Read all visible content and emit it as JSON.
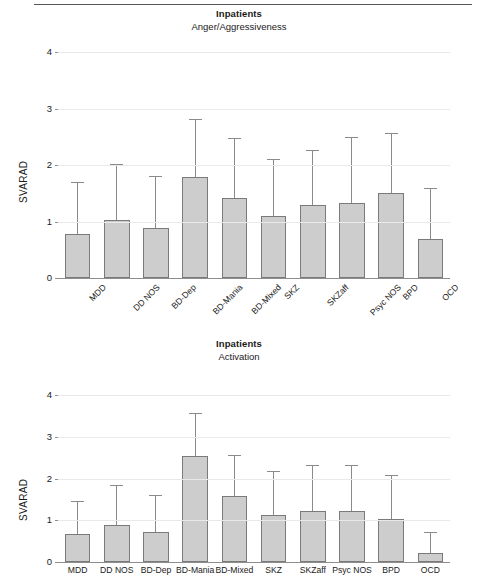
{
  "figure": {
    "panels": [
      {
        "id": "anger",
        "title": "Inpatients",
        "subtitle": "Anger/Aggressiveness",
        "ylabel": "SVARAD"
      },
      {
        "id": "activation",
        "title": "Inpatients",
        "subtitle": "Activation",
        "ylabel": "SVARAD"
      }
    ]
  },
  "chart_data": [
    {
      "type": "bar",
      "title": "Inpatients",
      "subtitle": "Anger/Aggressiveness",
      "xlabel": "",
      "ylabel": "SVARAD",
      "ylim": [
        0,
        4
      ],
      "yticks": [
        0,
        1,
        2,
        3,
        4
      ],
      "ticklabels": [
        "0",
        "1",
        "2",
        "3",
        "4"
      ],
      "grid": true,
      "legend": null,
      "label_rotation": -45,
      "categories": [
        "MDD",
        "DD NOS",
        "BD-Dep",
        "BD-Mania",
        "BD-Mixed",
        "SKZ",
        "SKZaff",
        "Psyc NOS",
        "BPD",
        "OCD"
      ],
      "values": [
        0.78,
        1.02,
        0.89,
        1.78,
        1.41,
        1.1,
        1.29,
        1.33,
        1.5,
        0.69
      ],
      "error_upper": [
        1.7,
        2.02,
        1.8,
        2.81,
        2.48,
        2.1,
        2.26,
        2.5,
        2.57,
        1.6
      ],
      "bar_color": "#cdcdcd",
      "bar_edge_color": "#7a7a7a",
      "error_color": "#8a8a8a"
    },
    {
      "type": "bar",
      "title": "Inpatients",
      "subtitle": "Activation",
      "xlabel": "",
      "ylabel": "SVARAD",
      "ylim": [
        0,
        4
      ],
      "yticks": [
        0,
        1,
        2,
        3,
        4
      ],
      "ticklabels": [
        "0",
        "1",
        "2",
        "3",
        "4"
      ],
      "grid": true,
      "legend": null,
      "label_rotation": 0,
      "categories": [
        "MDD",
        "DD NOS",
        "BD-Dep",
        "BD-Mania",
        "BD-Mixed",
        "SKZ",
        "SKZaff",
        "Psyc NOS",
        "BPD",
        "OCD"
      ],
      "values": [
        0.68,
        0.89,
        0.73,
        2.53,
        1.57,
        1.12,
        1.21,
        1.22,
        1.04,
        0.22
      ],
      "error_upper": [
        1.47,
        1.84,
        1.6,
        3.57,
        2.56,
        2.19,
        2.33,
        2.32,
        2.09,
        0.72
      ],
      "bar_color": "#cdcdcd",
      "bar_edge_color": "#7a7a7a",
      "error_color": "#8a8a8a"
    }
  ]
}
